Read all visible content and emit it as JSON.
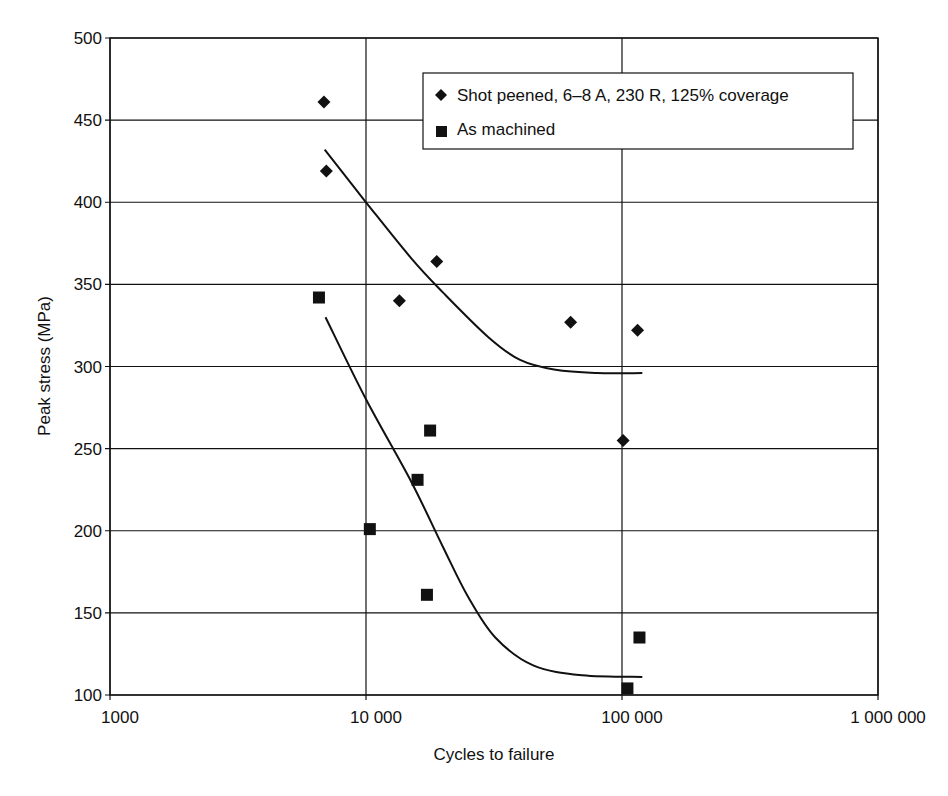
{
  "chart_data": {
    "type": "scatter",
    "title": "",
    "xlabel": "Cycles to failure",
    "ylabel": "Peak stress (MPa)",
    "xscale": "log",
    "xlim": [
      1000,
      1000000
    ],
    "ylim": [
      100,
      500
    ],
    "x_ticks": [
      1000,
      10000,
      100000,
      1000000
    ],
    "x_tick_labels": [
      "1000",
      "10 000",
      "100 000",
      "1 000 000"
    ],
    "y_ticks": [
      100,
      150,
      200,
      250,
      300,
      350,
      400,
      450,
      500
    ],
    "y_tick_labels": [
      "100",
      "150",
      "200",
      "250",
      "300",
      "350",
      "400",
      "450",
      "500"
    ],
    "grid": true,
    "legend_position": "upper right (inside)",
    "series": [
      {
        "name": "Shot peened, 6–8 A, 230 R, 125% coverage",
        "marker": "diamond",
        "points": [
          {
            "x": 6850,
            "y": 461
          },
          {
            "x": 7000,
            "y": 419
          },
          {
            "x": 13500,
            "y": 340
          },
          {
            "x": 18900,
            "y": 364
          },
          {
            "x": 63000,
            "y": 327
          },
          {
            "x": 101000,
            "y": 255
          },
          {
            "x": 115000,
            "y": 322
          }
        ],
        "trend_curve": [
          {
            "x": 6900,
            "y": 432
          },
          {
            "x": 10000,
            "y": 400
          },
          {
            "x": 15000,
            "y": 366
          },
          {
            "x": 20000,
            "y": 345
          },
          {
            "x": 30000,
            "y": 318
          },
          {
            "x": 40000,
            "y": 304
          },
          {
            "x": 55000,
            "y": 298
          },
          {
            "x": 80000,
            "y": 296
          },
          {
            "x": 120000,
            "y": 296
          }
        ]
      },
      {
        "name": "As machined",
        "marker": "square",
        "points": [
          {
            "x": 6550,
            "y": 342
          },
          {
            "x": 10350,
            "y": 201
          },
          {
            "x": 15900,
            "y": 231
          },
          {
            "x": 17300,
            "y": 161
          },
          {
            "x": 17800,
            "y": 261
          },
          {
            "x": 105000,
            "y": 104
          },
          {
            "x": 117000,
            "y": 135
          }
        ],
        "trend_curve": [
          {
            "x": 6950,
            "y": 330
          },
          {
            "x": 10000,
            "y": 280
          },
          {
            "x": 15000,
            "y": 230
          },
          {
            "x": 20000,
            "y": 190
          },
          {
            "x": 25000,
            "y": 160
          },
          {
            "x": 32000,
            "y": 135
          },
          {
            "x": 45000,
            "y": 118
          },
          {
            "x": 70000,
            "y": 112
          },
          {
            "x": 120000,
            "y": 111
          }
        ]
      }
    ]
  },
  "labels": {
    "xlabel": "Cycles to failure",
    "ylabel": "Peak stress (MPa)",
    "legend": [
      "Shot peened, 6–8 A, 230 R, 125% coverage",
      "As machined"
    ]
  },
  "colors": {
    "line": "#111111",
    "background": "#ffffff"
  }
}
